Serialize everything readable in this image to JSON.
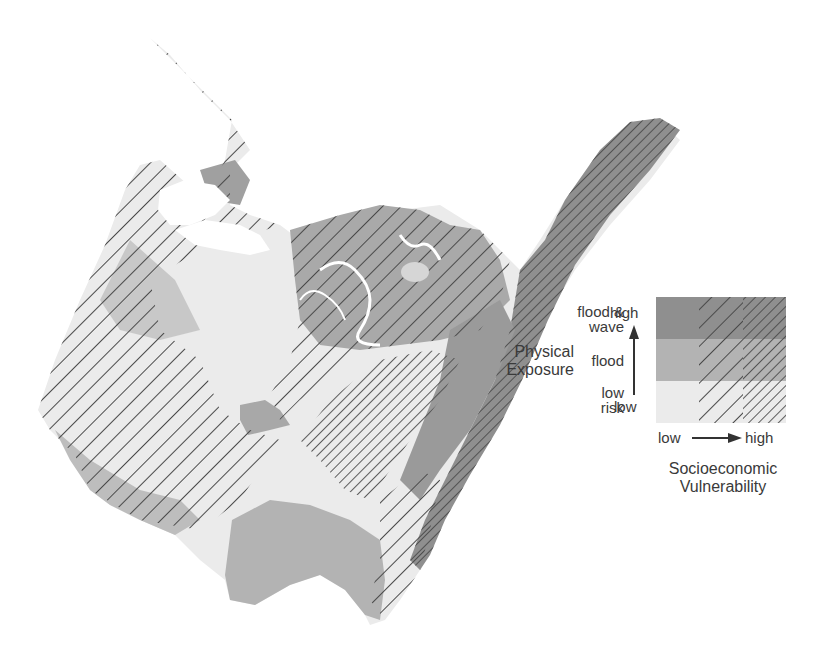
{
  "colors": {
    "low_risk": "#ebebeb",
    "flood": "#b3b3b3",
    "flood_wave": "#8f8f8f",
    "hatch": "#4a4a4a",
    "background": "#ffffff"
  },
  "legend": {
    "physical_exposure_title_line1": "Physical",
    "physical_exposure_title_line2": "Exposure",
    "rows": [
      {
        "label_line1": "flood &",
        "label_line2": "wave",
        "level": "flood_wave"
      },
      {
        "label_line1": "flood",
        "label_line2": "",
        "level": "flood"
      },
      {
        "label_line1": "low",
        "label_line2": "risk",
        "level": "low_risk"
      }
    ],
    "y_axis_high": "high",
    "y_axis_low": "low",
    "x_axis_low": "low",
    "x_axis_high": "high",
    "socioeconomic_title_line1": "Socioeconomic",
    "socioeconomic_title_line2": "Vulnerability",
    "columns": [
      "low",
      "medium",
      "high"
    ]
  },
  "map": {
    "description": "Coastal region shaded by physical exposure (fill tone) and hatched by socioeconomic vulnerability (hatch density)"
  }
}
